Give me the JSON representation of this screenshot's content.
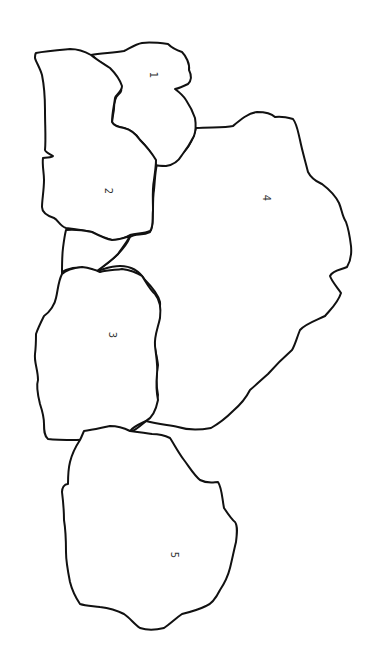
{
  "diagram": {
    "type": "region-map",
    "colors": {
      "stroke": "#111111",
      "background": "#ffffff",
      "label": "#333333"
    },
    "regions": [
      {
        "id": "1",
        "label": "1",
        "label_pos": [
          153,
          75
        ]
      },
      {
        "id": "2",
        "label": "2",
        "label_pos": [
          108,
          191
        ]
      },
      {
        "id": "3",
        "label": "3",
        "label_pos": [
          112,
          335
        ]
      },
      {
        "id": "4",
        "label": "4",
        "label_pos": [
          266,
          198
        ]
      },
      {
        "id": "5",
        "label": "5",
        "label_pos": [
          174,
          555
        ]
      }
    ],
    "label_rotation": "90deg"
  }
}
